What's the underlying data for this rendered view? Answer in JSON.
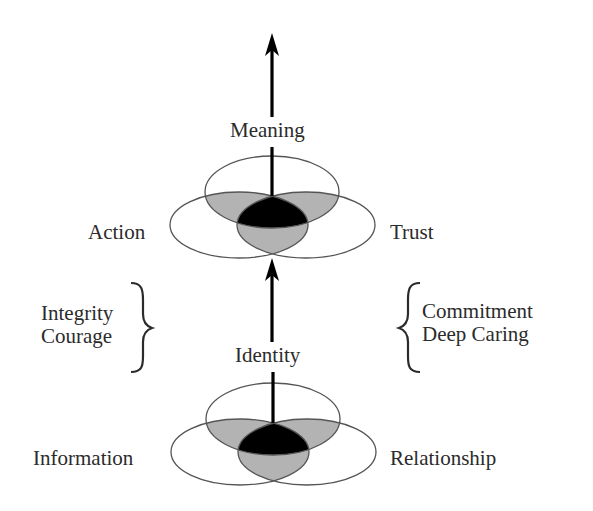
{
  "diagram": {
    "type": "stacked three-circle venn with arrows",
    "colors": {
      "background": "#ffffff",
      "outline": "#555555",
      "pair_overlap": "#b3b3b3",
      "center_overlap": "#000000",
      "arrow": "#000000",
      "text": "#2b2b2b"
    },
    "top_group": {
      "label_top": "Meaning",
      "label_left": "Action",
      "label_right": "Trust"
    },
    "middle": {
      "label_center": "Identity",
      "left_bracket_items": [
        "Integrity",
        "Courage"
      ],
      "right_bracket_items": [
        "Commitment",
        "Deep Caring"
      ]
    },
    "bottom_group": {
      "label_left": "Information",
      "label_right": "Relationship"
    }
  }
}
